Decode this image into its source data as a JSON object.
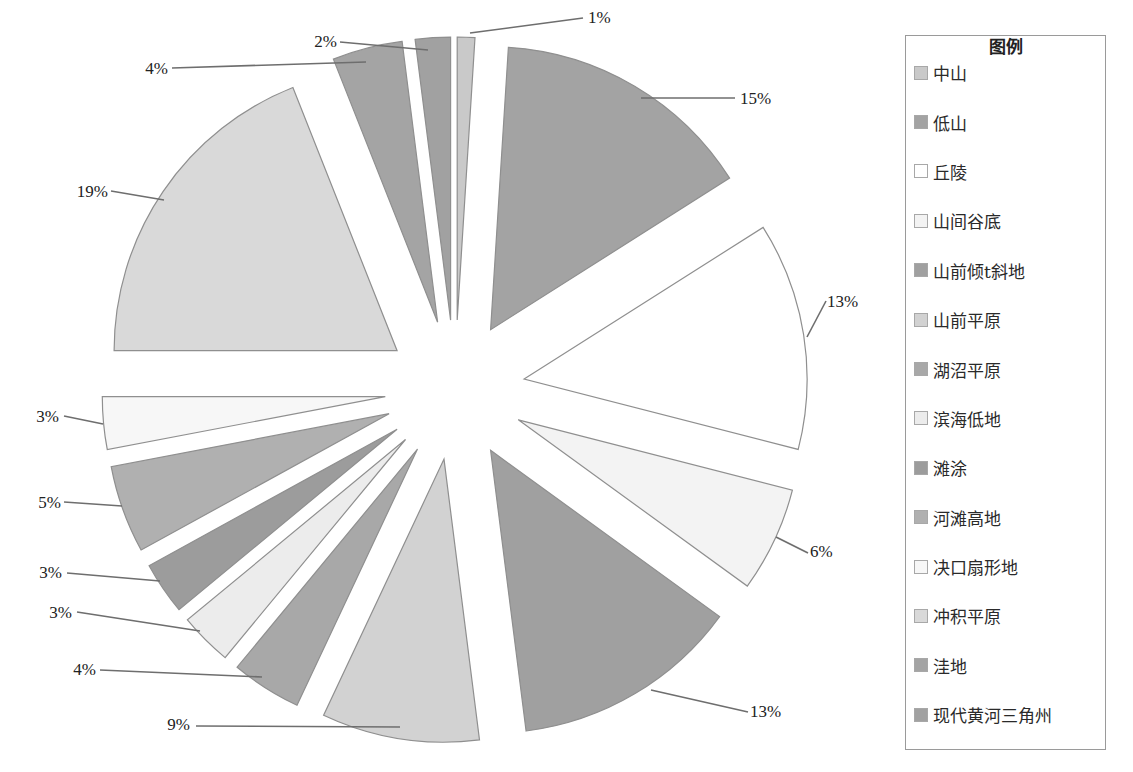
{
  "chart_data": {
    "type": "pie",
    "title": "",
    "exploded": true,
    "start_angle_deg": 0,
    "direction": "clockwise",
    "legend_title": "图例",
    "legend_position": "right",
    "categories": [
      "中山",
      "低山",
      "丘陵",
      "山间谷底",
      "山前倾t斜地",
      "山前平原",
      "湖沼平原",
      "滨海低地",
      "滩涂",
      "河滩高地",
      "决口扇形地",
      "冲积平原",
      "洼地",
      "现代黄河三角州"
    ],
    "values": [
      1,
      15,
      13,
      6,
      13,
      9,
      4,
      3,
      3,
      5,
      3,
      19,
      4,
      2
    ],
    "labels": [
      "1%",
      "15%",
      "13%",
      "6%",
      "13%",
      "9%",
      "4%",
      "3%",
      "3%",
      "5%",
      "3%",
      "19%",
      "4%",
      "2%"
    ],
    "colors": [
      "#c9c9c9",
      "#a3a3a3",
      "#ffffff",
      "#f3f3f3",
      "#a0a0a0",
      "#d2d2d2",
      "#a8a8a8",
      "#ececec",
      "#9c9c9c",
      "#b0b0b0",
      "#f7f7f7",
      "#d9d9d9",
      "#a4a4a4",
      "#a1a1a1"
    ],
    "label_positions": [
      {
        "tx": 588,
        "ty": 23,
        "anchor": "start",
        "lx1": 583,
        "ly1": 18,
        "lx2": 470,
        "ly2": 33
      },
      {
        "tx": 740,
        "ty": 104,
        "anchor": "start",
        "lx1": 735,
        "ly1": 98,
        "lx2": 641,
        "ly2": 98
      },
      {
        "tx": 827,
        "ty": 307,
        "anchor": "start",
        "lx1": 826,
        "ly1": 301,
        "lx2": 807,
        "ly2": 337
      },
      {
        "tx": 810,
        "ty": 557,
        "anchor": "start",
        "lx1": 808,
        "ly1": 553,
        "lx2": 776,
        "ly2": 537
      },
      {
        "tx": 750,
        "ty": 717,
        "anchor": "start",
        "lx1": 748,
        "ly1": 712,
        "lx2": 651,
        "ly2": 690
      },
      {
        "tx": 190,
        "ty": 730,
        "anchor": "end",
        "lx1": 196,
        "ly1": 726,
        "lx2": 400,
        "ly2": 727
      },
      {
        "tx": 96,
        "ty": 675,
        "anchor": "end",
        "lx1": 100,
        "ly1": 670,
        "lx2": 262,
        "ly2": 677
      },
      {
        "tx": 72,
        "ty": 618,
        "anchor": "end",
        "lx1": 77,
        "ly1": 612,
        "lx2": 200,
        "ly2": 631
      },
      {
        "tx": 62,
        "ty": 578,
        "anchor": "end",
        "lx1": 67,
        "ly1": 573,
        "lx2": 160,
        "ly2": 581
      },
      {
        "tx": 61,
        "ty": 508,
        "anchor": "end",
        "lx1": 64,
        "ly1": 502,
        "lx2": 122,
        "ly2": 506
      },
      {
        "tx": 59,
        "ty": 422,
        "anchor": "end",
        "lx1": 64,
        "ly1": 416,
        "lx2": 103,
        "ly2": 424
      },
      {
        "tx": 108,
        "ty": 197,
        "anchor": "end",
        "lx1": 111,
        "ly1": 191,
        "lx2": 164,
        "ly2": 200
      },
      {
        "tx": 168,
        "ty": 74,
        "anchor": "end",
        "lx1": 172,
        "ly1": 68,
        "lx2": 366,
        "ly2": 62
      },
      {
        "tx": 337,
        "ty": 47,
        "anchor": "end",
        "lx1": 340,
        "ly1": 42,
        "lx2": 428,
        "ly2": 50
      }
    ],
    "geometry": {
      "cx": 455,
      "cy": 390,
      "r": 283,
      "explode": 70
    }
  },
  "legend": {
    "title": "图例",
    "items": [
      {
        "label": "中山",
        "color": "#c9c9c9"
      },
      {
        "label": "低山",
        "color": "#a3a3a3"
      },
      {
        "label": "丘陵",
        "color": "#ffffff"
      },
      {
        "label": "山间谷底",
        "color": "#f3f3f3"
      },
      {
        "label": "山前倾t斜地",
        "color": "#a0a0a0"
      },
      {
        "label": "山前平原",
        "color": "#d2d2d2"
      },
      {
        "label": "湖沼平原",
        "color": "#a8a8a8"
      },
      {
        "label": "滨海低地",
        "color": "#ececec"
      },
      {
        "label": "滩涂",
        "color": "#9c9c9c"
      },
      {
        "label": "河滩高地",
        "color": "#b0b0b0"
      },
      {
        "label": "决口扇形地",
        "color": "#f7f7f7"
      },
      {
        "label": "冲积平原",
        "color": "#d9d9d9"
      },
      {
        "label": "洼地",
        "color": "#a4a4a4"
      },
      {
        "label": "现代黄河三角州",
        "color": "#a1a1a1"
      }
    ]
  }
}
